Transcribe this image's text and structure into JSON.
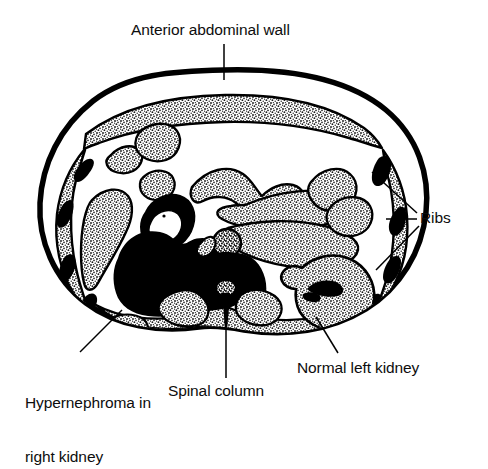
{
  "figure": {
    "type": "medical-illustration",
    "background_color": "#ffffff",
    "ink_color": "#000000",
    "stipple_color": "#3a3a3a"
  },
  "labels": {
    "anterior_wall": "Anterior abdominal wall",
    "ribs": "Ribs",
    "hypernephroma_line1": "Hypernephroma in",
    "hypernephroma_line2": "right kidney",
    "spinal_column": "Spinal column",
    "normal_left_kidney": "Normal left kidney"
  },
  "annotations": [
    {
      "name": "anterior-abdominal-wall",
      "text": "Anterior abdominal wall",
      "leader": "vertical line from text down to the anterior body wall"
    },
    {
      "name": "ribs",
      "text": "Ribs",
      "leader": "three lines fanning left to the right lateral body wall"
    },
    {
      "name": "hypernephroma-in-right-kidney",
      "text": "Hypernephroma in right kidney",
      "leader": "diagonal line up-right to the solid black renal mass"
    },
    {
      "name": "spinal-column",
      "text": "Spinal column",
      "leader": "vertical line up to the vertebral body and spinous process"
    },
    {
      "name": "normal-left-kidney",
      "text": "Normal left kidney",
      "leader": "diagonal line up-left to the stippled left kidney"
    }
  ]
}
